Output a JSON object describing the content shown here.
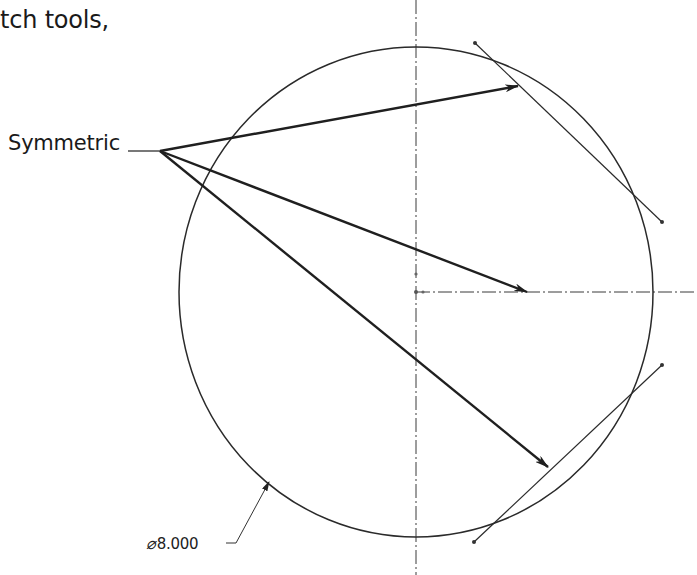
{
  "text": {
    "intro_fragment": "tch tools,",
    "constraint_label": "Symmetric",
    "dimension": {
      "symbol": "⌀",
      "value": "8.000"
    }
  },
  "colors": {
    "ink": "#1a1a1a",
    "geometry": "#2a2a2a",
    "centerline": "#3a3a3a",
    "background": "#ffffff"
  },
  "geometry": {
    "circle": {
      "cx": 416,
      "cy": 292,
      "rx": 237,
      "ry": 245
    },
    "centerline_vertical": {
      "x": 416,
      "y1": 0,
      "y2": 575
    },
    "centerline_horizontal": {
      "y": 292,
      "x1": 416,
      "x2": 697
    },
    "line_upper": {
      "x1": 475,
      "y1": 43,
      "x2": 662,
      "y2": 222
    },
    "line_lower": {
      "x1": 474,
      "y1": 542,
      "x2": 662,
      "y2": 365
    },
    "leader_origin": {
      "x": 160,
      "y": 151
    },
    "arrows": [
      {
        "target": "line_upper",
        "x2": 518,
        "y2": 86
      },
      {
        "target": "centerline_horizontal",
        "x2": 527,
        "y2": 292
      },
      {
        "target": "line_lower",
        "x2": 548,
        "y2": 467
      }
    ],
    "dimension_leader": {
      "x1": 228,
      "y1": 543,
      "xk": 236,
      "yk": 543,
      "x2": 269,
      "y2": 482
    }
  }
}
